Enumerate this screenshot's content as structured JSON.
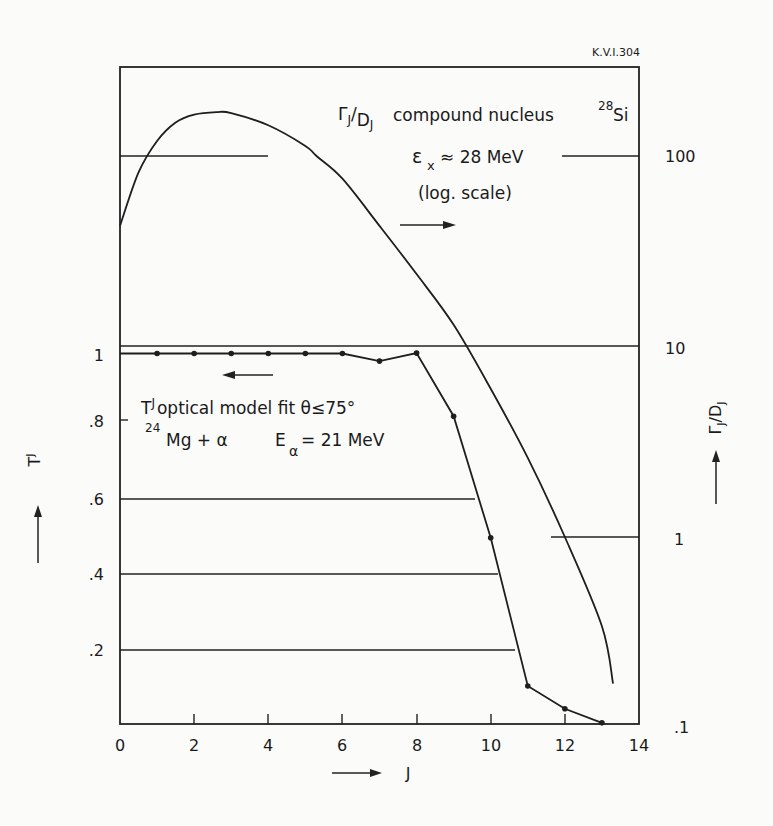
{
  "figure_id": "K.V.I.304",
  "chart_data": [
    {
      "type": "line",
      "title": "T^J optical model fit θ≤75°, 24Mg+α, Eα = 21 MeV",
      "xlabel": "J",
      "ylabel": "T^J",
      "xlim": [
        0,
        14
      ],
      "ylim": [
        0,
        1
      ],
      "x_ticks": [
        0,
        2,
        4,
        6,
        8,
        10,
        12,
        14
      ],
      "y_ticks": [
        "0",
        ".2",
        ".4",
        ".6",
        ".8",
        "1"
      ],
      "axis": "left",
      "series": [
        {
          "name": "T^J optical model fit",
          "x": [
            0,
            1,
            2,
            3,
            4,
            5,
            6,
            7,
            8,
            9,
            10,
            11,
            12,
            13
          ],
          "values": [
            0.975,
            0.975,
            0.975,
            0.975,
            0.975,
            0.975,
            0.975,
            0.955,
            0.976,
            0.81,
            0.49,
            0.1,
            0.04,
            0.003
          ],
          "markers": true
        }
      ]
    },
    {
      "type": "line",
      "title": "ΓJ/DJ compound nucleus 28Si, εx ≈ 28 MeV (log. scale)",
      "xlabel": "J",
      "ylabel": "ΓJ/DJ",
      "xlim": [
        0,
        14
      ],
      "ylim": [
        0.1,
        300
      ],
      "yscale": "log",
      "y_ticks": [
        ".1",
        "1",
        "10",
        "100"
      ],
      "axis": "right",
      "series": [
        {
          "name": "ΓJ/DJ",
          "x": [
            0,
            0.5,
            1,
            1.5,
            2,
            2.6,
            3,
            4,
            5,
            5.3,
            6,
            7,
            8,
            9,
            10,
            11,
            12,
            13,
            13.3
          ],
          "values": [
            43,
            82,
            120,
            150,
            165,
            170,
            168,
            145,
            113,
            100,
            76,
            43,
            24,
            13,
            6.0,
            2.6,
            1.0,
            0.34,
            0.17
          ],
          "markers": false
        }
      ]
    }
  ],
  "annotations": {
    "gamma_label_main": "Γ",
    "gamma_label_sub": "J",
    "gamma_label_den": "D",
    "gamma_label_den_sub": "J",
    "compound_text": "compound nucleus",
    "si_mass": "28",
    "si_symbol": "Si",
    "eps_symbol": "ε",
    "eps_sub": "x",
    "eps_value": "≈ 28 MeV",
    "log_scale": "(log. scale)",
    "t_symbol": "T",
    "t_sup": "J",
    "fit_text": "optical model fit  θ≤75°",
    "mg_mass": "24",
    "mg_reaction": "Mg + α",
    "e_symbol": "E",
    "e_sub": "α",
    "e_value": "= 21 MeV"
  },
  "axes": {
    "x_label": "J",
    "left_label_main": "T",
    "left_label_sup": "J",
    "right_label": "ΓJ/DJ",
    "left_ticks": [
      "1",
      ".8",
      ".6",
      ".4",
      ".2",
      "0"
    ],
    "right_ticks": [
      "100",
      "10",
      "1",
      ".1"
    ],
    "bottom_ticks": [
      "0",
      "2",
      "4",
      "6",
      "8",
      "10",
      "12",
      "14"
    ]
  }
}
